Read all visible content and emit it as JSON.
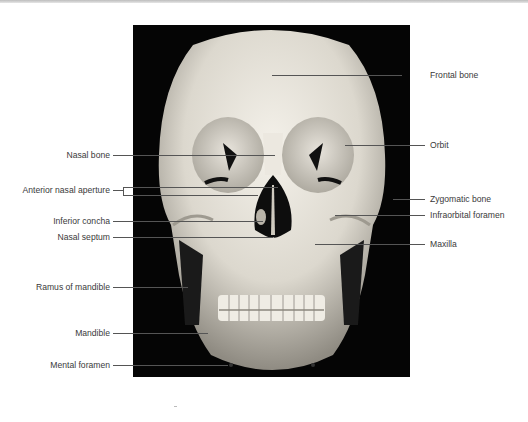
{
  "figure": {
    "labels_left": [
      {
        "id": "nasal-bone",
        "text": "Nasal bone",
        "y": 155
      },
      {
        "id": "anterior-nasal-aperture",
        "text": "Anterior nasal aperture",
        "y": 190
      },
      {
        "id": "inferior-concha",
        "text": "Inferior concha",
        "y": 221
      },
      {
        "id": "nasal-septum",
        "text": "Nasal septum",
        "y": 237
      },
      {
        "id": "ramus-of-mandible",
        "text": "Ramus of mandible",
        "y": 287
      },
      {
        "id": "mandible",
        "text": "Mandible",
        "y": 333
      },
      {
        "id": "mental-foramen",
        "text": "Mental foramen",
        "y": 365
      }
    ],
    "labels_right": [
      {
        "id": "frontal-bone",
        "text": "Frontal bone",
        "y": 75
      },
      {
        "id": "orbit",
        "text": "Orbit",
        "y": 145
      },
      {
        "id": "zygomatic-bone",
        "text": "Zygomatic bone",
        "y": 199
      },
      {
        "id": "infraorbital-foramen",
        "text": "Infraorbital foramen",
        "y": 215
      },
      {
        "id": "maxilla",
        "text": "Maxilla",
        "y": 244
      }
    ]
  }
}
